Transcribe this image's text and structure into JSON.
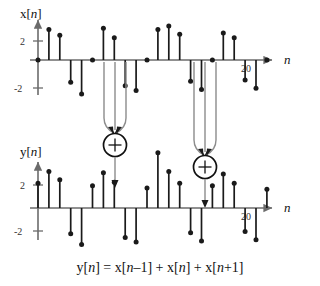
{
  "figure": {
    "equation": "y[n] = x[n–1] + x[n] + x[n+1]",
    "axis_label_n": "n",
    "upper_signal_label": "x[n]",
    "lower_signal_label": "y[n]",
    "adder_symbol": "+",
    "colors": {
      "stem": "#1a1a1a",
      "axis": "#6b6b6b",
      "arrow": "#8c8c8c",
      "text": "#111111"
    },
    "upper_plot": {
      "ylabel": "x[n]",
      "yticks": [
        "2",
        "-2"
      ],
      "ytick_values": [
        2,
        -2
      ],
      "xtick_label": "20",
      "xtick_value": 20
    },
    "lower_plot": {
      "ylabel": "y[n]",
      "yticks": [
        "2",
        "-2"
      ],
      "ytick_values": [
        2,
        -2
      ],
      "xtick_label": "20",
      "xtick_value": 20
    }
  },
  "chart_data": {
    "type": "line",
    "title": "y[n] = x[n–1] + x[n] + x[n+1]",
    "xlabel": "n",
    "ylabel": "x[n], y[n]",
    "grid": false,
    "legend": "none",
    "ylim": [
      -2.6,
      2.6
    ],
    "xlim": [
      -1,
      25
    ],
    "subplots": [
      {
        "name": "upper",
        "ylabel": "x[n]",
        "type": "stem",
        "x": [
          0,
          1,
          2,
          3,
          4,
          5,
          6,
          7,
          8,
          9,
          10,
          11,
          12,
          13,
          14,
          15,
          16,
          17,
          18,
          19,
          20,
          21
        ],
        "values": [
          0,
          1.3,
          1.05,
          -0.95,
          -1.45,
          0,
          1.35,
          0.95,
          -1.1,
          -1.3,
          0,
          1.3,
          1.45,
          1.1,
          -0.9,
          -1.25,
          0,
          1.15,
          0.95,
          -0.85,
          -1.2,
          0
        ]
      },
      {
        "name": "lower",
        "ylabel": "y[n]",
        "type": "stem",
        "x": [
          0,
          1,
          2,
          3,
          4,
          5,
          6,
          7,
          8,
          9,
          10,
          11,
          12,
          13,
          14,
          15,
          16,
          17,
          18,
          19,
          20,
          21
        ],
        "values": [
          1.05,
          1.55,
          1.2,
          -1.1,
          -1.55,
          0.95,
          1.5,
          1.1,
          -1.25,
          -1.45,
          0.85,
          2.35,
          1.55,
          1.05,
          -1.05,
          -1.4,
          0.95,
          1.45,
          1.05,
          -1.0,
          -1.35,
          0.8
        ]
      }
    ],
    "annotations": [
      {
        "name": "adder-left",
        "symbol": "+",
        "inputs_x": [
          5,
          6,
          7
        ],
        "output_x": 6
      },
      {
        "name": "adder-right",
        "symbol": "+",
        "inputs_x": [
          10,
          11,
          12
        ],
        "output_x": 11
      }
    ]
  }
}
